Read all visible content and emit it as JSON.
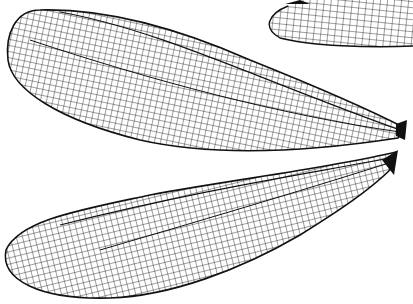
{
  "image": {
    "subject": "insect wing venation illustration",
    "width": 413,
    "height": 304,
    "colors": {
      "background": "#ffffff",
      "ink": "#111111"
    },
    "wings": [
      {
        "name": "upper-left-forewing",
        "position": "top-left, spanning to right edge"
      },
      {
        "name": "top-right-partial-wing",
        "position": "top-right corner, cut off"
      },
      {
        "name": "lower-hindwing",
        "position": "bottom, base at right"
      }
    ]
  }
}
